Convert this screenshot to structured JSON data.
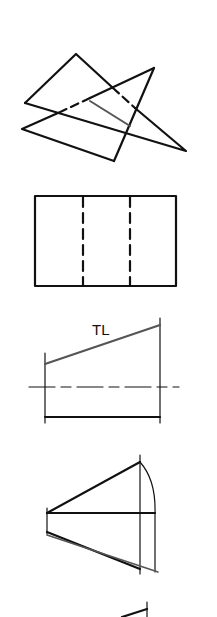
{
  "figures": [
    {
      "id": "intersecting-planes",
      "description": "Two intersecting triangular planes with hidden edges dashed and line of intersection shown"
    },
    {
      "id": "rectangle-hidden-lines",
      "description": "Rectangle view with two vertical dashed hidden lines"
    },
    {
      "id": "true-length-view",
      "label": "TL",
      "description": "Line shown in true length above a center line"
    },
    {
      "id": "revolution-construction",
      "description": "Revolution method construction with arc and projection lines"
    },
    {
      "id": "partial-figure",
      "description": "Partially visible construction at bottom edge"
    }
  ],
  "colors": {
    "line": "#111111",
    "intersection": "#555555",
    "background": "#ffffff"
  }
}
